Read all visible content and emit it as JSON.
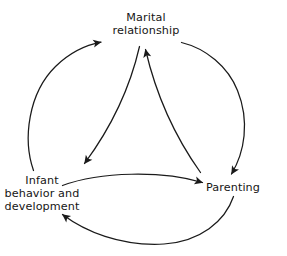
{
  "figure": {
    "type": "cyclical-process-diagram",
    "background_color": "#ffffff",
    "stroke_color": "#1a1a1a",
    "text_color": "#161616",
    "node_count": 3,
    "arrow_count": 6
  },
  "nodes": [
    {
      "id": "marital",
      "label": "Marital\nrelationship",
      "position": "top"
    },
    {
      "id": "infant",
      "label": "Infant\nbehavior and\ndevelopment",
      "position": "bottom-left"
    },
    {
      "id": "parenting",
      "label": "Parenting",
      "position": "bottom-right"
    }
  ],
  "arrows": [
    {
      "id": "outer-infant-to-marital",
      "from": "infant",
      "to": "marital",
      "path": "outer-arc-left",
      "direction": "counterclockwise"
    },
    {
      "id": "outer-marital-to-parenting",
      "from": "marital",
      "to": "parenting",
      "path": "outer-arc-right",
      "direction": "counterclockwise"
    },
    {
      "id": "outer-parenting-to-infant",
      "from": "parenting",
      "to": "infant",
      "path": "outer-arc-bottom",
      "direction": "counterclockwise"
    },
    {
      "id": "inner-marital-to-infant",
      "from": "marital",
      "to": "infant",
      "path": "inner-curve-left",
      "direction": "clockwise"
    },
    {
      "id": "inner-infant-to-parenting",
      "from": "infant",
      "to": "parenting",
      "path": "inner-curve-bottom",
      "direction": "clockwise"
    },
    {
      "id": "inner-parenting-to-marital",
      "from": "parenting",
      "to": "marital",
      "path": "inner-curve-right",
      "direction": "clockwise"
    }
  ]
}
